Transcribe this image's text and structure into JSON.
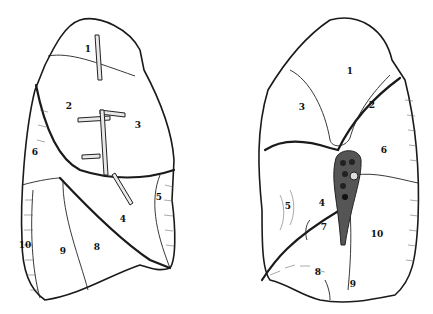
{
  "figures": [
    {
      "name": "left-lung-lateral-view",
      "segment_labels": [
        {
          "id": "1",
          "x": 88,
          "y": 52
        },
        {
          "id": "2",
          "x": 69,
          "y": 109
        },
        {
          "id": "3",
          "x": 138,
          "y": 128
        },
        {
          "id": "6",
          "x": 35,
          "y": 155
        },
        {
          "id": "5",
          "x": 159,
          "y": 200
        },
        {
          "id": "4",
          "x": 123,
          "y": 222
        },
        {
          "id": "10",
          "x": 25,
          "y": 248
        },
        {
          "id": "9",
          "x": 63,
          "y": 254
        },
        {
          "id": "8",
          "x": 97,
          "y": 250
        }
      ]
    },
    {
      "name": "right-lung-medial-view",
      "segment_labels": [
        {
          "id": "1",
          "x": 350,
          "y": 74
        },
        {
          "id": "3",
          "x": 302,
          "y": 110
        },
        {
          "id": "2",
          "x": 372,
          "y": 108
        },
        {
          "id": "6",
          "x": 384,
          "y": 153
        },
        {
          "id": "5",
          "x": 288,
          "y": 209
        },
        {
          "id": "4",
          "x": 322,
          "y": 206
        },
        {
          "id": "7",
          "x": 324,
          "y": 230
        },
        {
          "id": "10",
          "x": 377,
          "y": 237
        },
        {
          "id": "8",
          "x": 318,
          "y": 275
        },
        {
          "id": "9",
          "x": 353,
          "y": 287
        }
      ]
    }
  ]
}
